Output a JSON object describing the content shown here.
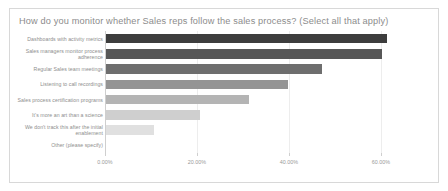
{
  "card": {
    "title": "How do you monitor whether Sales reps follow the sales process? (Select all that apply)"
  },
  "chart_data": {
    "type": "bar",
    "orientation": "horizontal",
    "title": "How do you monitor whether Sales reps follow the sales process? (Select all that apply)",
    "xlabel": "",
    "ylabel": "",
    "xlim": [
      0,
      70
    ],
    "grid": true,
    "legend": "none",
    "tick_labels": [
      "0.00%",
      "20.00%",
      "40.00%",
      "60.00%"
    ],
    "tick_values": [
      0,
      20,
      40,
      60
    ],
    "categories": [
      "Dashboards with activity metrics",
      "Sales managers monitor process adherence",
      "Regular Sales team meetings",
      "Listening to call recordings",
      "Sales process certification programs",
      "It's more an art than a science",
      "We don't track this after the initial enablement",
      "Other (please specify)"
    ],
    "values": [
      61.0,
      60.0,
      47.0,
      39.5,
      31.0,
      20.5,
      10.5,
      0.0
    ],
    "bar_colors": [
      "#3d3d3d",
      "#575757",
      "#6e6e6e",
      "#949494",
      "#b4b4b4",
      "#cfcfcf",
      "#e0e0e0",
      "#ededed"
    ]
  }
}
